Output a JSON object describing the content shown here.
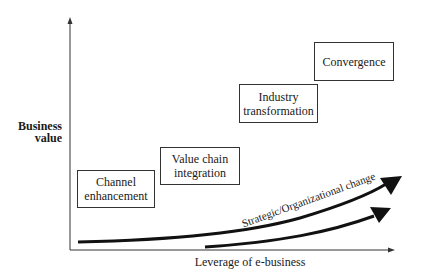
{
  "diagram": {
    "y_axis_label": "Business value",
    "y_axis_label_lines": [
      "Business",
      "value"
    ],
    "x_axis_label": "Leverage of e-business",
    "stages": [
      {
        "label": "Channel enhancement",
        "lines": [
          "Channel",
          "enhancement"
        ]
      },
      {
        "label": "Value chain integration",
        "lines": [
          "Value chain",
          "integration"
        ]
      },
      {
        "label": "Industry transformation",
        "lines": [
          "Industry",
          "transformation"
        ]
      },
      {
        "label": "Convergence",
        "lines": [
          "Convergence"
        ]
      }
    ],
    "curves": [
      {
        "name": "business-value-curve",
        "label": ""
      },
      {
        "name": "strategic-change-curve",
        "label": "Strategic/Organizational change"
      }
    ],
    "colors": {
      "line": "#1a1a1a",
      "axis": "#333333",
      "box_border": "#333333",
      "background": "#ffffff"
    }
  }
}
